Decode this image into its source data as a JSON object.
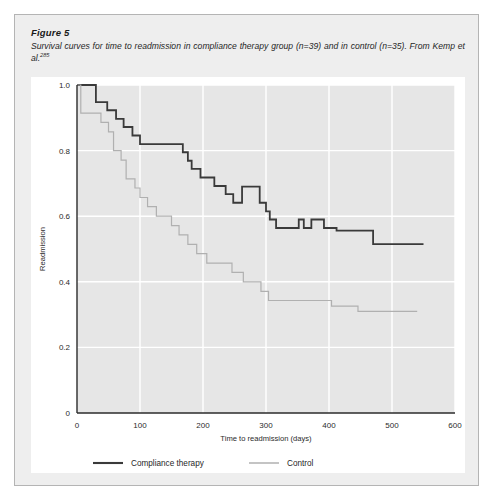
{
  "figure": {
    "label": "Figure 5",
    "caption": "Survival curves for time to readmission in compliance therapy group (n=39) and in control (n=35). From Kemp et al.",
    "reference_superscript": "285"
  },
  "chart_data": {
    "type": "line",
    "subtype": "kaplan-meier-step",
    "title": "",
    "xlabel": "Time to readmission (days)",
    "ylabel": "Readmission",
    "xlim": [
      0,
      600
    ],
    "ylim": [
      0,
      1.0
    ],
    "xticks": [
      0,
      100,
      200,
      300,
      400,
      500,
      600
    ],
    "xtick_labels": [
      "0",
      "100",
      "200",
      "300",
      "400",
      "500",
      "600"
    ],
    "yticks": [
      0,
      0.2,
      0.4,
      0.6,
      0.8,
      1.0
    ],
    "ytick_labels": [
      "0",
      "0.2",
      "0.4",
      "0.6",
      "0.8",
      "1.0"
    ],
    "grid": true,
    "grid_color": "#ffffff",
    "plot_background": "#e6e6e6",
    "legend_position": "below",
    "series": [
      {
        "name": "Compliance therapy",
        "color": "#3a3a3a",
        "width": 1.8,
        "n": 39,
        "points": [
          [
            0,
            1.0
          ],
          [
            30,
            1.0
          ],
          [
            30,
            0.948
          ],
          [
            48,
            0.948
          ],
          [
            48,
            0.923
          ],
          [
            62,
            0.923
          ],
          [
            62,
            0.897
          ],
          [
            74,
            0.897
          ],
          [
            74,
            0.872
          ],
          [
            88,
            0.872
          ],
          [
            88,
            0.846
          ],
          [
            100,
            0.846
          ],
          [
            100,
            0.82
          ],
          [
            168,
            0.82
          ],
          [
            168,
            0.795
          ],
          [
            176,
            0.795
          ],
          [
            176,
            0.769
          ],
          [
            182,
            0.769
          ],
          [
            182,
            0.744
          ],
          [
            196,
            0.744
          ],
          [
            196,
            0.718
          ],
          [
            218,
            0.718
          ],
          [
            218,
            0.692
          ],
          [
            236,
            0.692
          ],
          [
            236,
            0.667
          ],
          [
            248,
            0.667
          ],
          [
            248,
            0.641
          ],
          [
            262,
            0.641
          ],
          [
            262,
            0.69
          ],
          [
            290,
            0.69
          ],
          [
            290,
            0.641
          ],
          [
            300,
            0.641
          ],
          [
            300,
            0.615
          ],
          [
            306,
            0.615
          ],
          [
            306,
            0.59
          ],
          [
            316,
            0.59
          ],
          [
            316,
            0.564
          ],
          [
            352,
            0.564
          ],
          [
            352,
            0.59
          ],
          [
            360,
            0.59
          ],
          [
            360,
            0.564
          ],
          [
            372,
            0.564
          ],
          [
            372,
            0.59
          ],
          [
            392,
            0.59
          ],
          [
            392,
            0.564
          ],
          [
            412,
            0.564
          ],
          [
            412,
            0.556
          ],
          [
            470,
            0.556
          ],
          [
            470,
            0.515
          ],
          [
            550,
            0.515
          ]
        ]
      },
      {
        "name": "Control",
        "color": "#b0b0b0",
        "width": 1.2,
        "n": 35,
        "points": [
          [
            0,
            1.0
          ],
          [
            6,
            1.0
          ],
          [
            6,
            0.914
          ],
          [
            38,
            0.914
          ],
          [
            38,
            0.886
          ],
          [
            50,
            0.886
          ],
          [
            50,
            0.857
          ],
          [
            58,
            0.857
          ],
          [
            58,
            0.8
          ],
          [
            70,
            0.8
          ],
          [
            70,
            0.771
          ],
          [
            78,
            0.771
          ],
          [
            78,
            0.714
          ],
          [
            92,
            0.714
          ],
          [
            92,
            0.686
          ],
          [
            100,
            0.686
          ],
          [
            100,
            0.657
          ],
          [
            112,
            0.657
          ],
          [
            112,
            0.629
          ],
          [
            126,
            0.629
          ],
          [
            126,
            0.6
          ],
          [
            150,
            0.6
          ],
          [
            150,
            0.571
          ],
          [
            162,
            0.571
          ],
          [
            162,
            0.543
          ],
          [
            176,
            0.543
          ],
          [
            176,
            0.514
          ],
          [
            190,
            0.514
          ],
          [
            190,
            0.486
          ],
          [
            206,
            0.486
          ],
          [
            206,
            0.457
          ],
          [
            246,
            0.457
          ],
          [
            246,
            0.429
          ],
          [
            264,
            0.429
          ],
          [
            264,
            0.4
          ],
          [
            292,
            0.4
          ],
          [
            292,
            0.371
          ],
          [
            304,
            0.371
          ],
          [
            304,
            0.343
          ],
          [
            404,
            0.343
          ],
          [
            404,
            0.326
          ],
          [
            446,
            0.326
          ],
          [
            446,
            0.31
          ],
          [
            540,
            0.31
          ]
        ]
      }
    ],
    "legend": [
      {
        "label": "Compliance therapy",
        "color": "#3a3a3a",
        "width": 1.8
      },
      {
        "label": "Control",
        "color": "#b0b0b0",
        "width": 1.2
      }
    ]
  }
}
